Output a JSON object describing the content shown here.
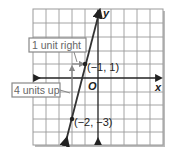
{
  "diagram": {
    "type": "coordinate-plane-line",
    "grid": {
      "x_min": -5,
      "x_max": 5,
      "y_min": -5,
      "y_max": 5
    },
    "axes": {
      "x_label": "x",
      "y_label": "y",
      "origin_label": "O"
    },
    "points": [
      {
        "label": "(−1, 1)",
        "x": -1,
        "y": 1
      },
      {
        "label": "(−2, −3)",
        "x": -2,
        "y": -3
      }
    ],
    "annotations": [
      {
        "label": "1 unit right"
      },
      {
        "label": "4 units up"
      }
    ],
    "colors": {
      "grid": "#9a9a9a",
      "line": "#333333",
      "annotation_box": "#888888",
      "annotation_text": "#666666"
    }
  }
}
